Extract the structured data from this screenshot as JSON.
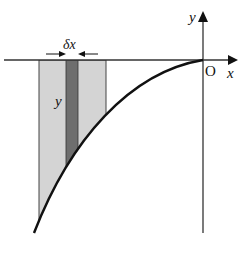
{
  "diagram": {
    "type": "area-under-curve strip element",
    "labels": {
      "y_axis": "y",
      "x_axis": "x",
      "origin": "O",
      "strip_width": "δx",
      "strip_height": "y"
    },
    "colors": {
      "background": "#ffffff",
      "light_region": "#d4d4d4",
      "dark_strip": "#6e6e6e",
      "curve": "#111111",
      "axes": "#333333"
    },
    "geometry": {
      "origin": [
        203,
        60
      ],
      "x_axis_range": [
        4,
        238
      ],
      "y_axis_range": [
        12,
        233
      ],
      "light_region_x": [
        39,
        106
      ],
      "dark_strip_x": [
        66,
        78
      ],
      "curve_endpoints": [
        [
          34,
          233
        ],
        [
          203,
          60
        ]
      ]
    }
  }
}
